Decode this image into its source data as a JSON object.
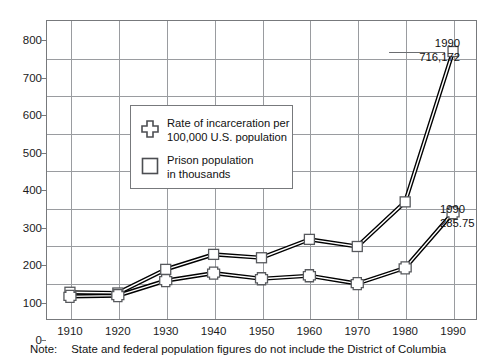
{
  "chart_data": {
    "type": "line",
    "title": "",
    "xlabel": "",
    "ylabel": "",
    "x": [
      1910,
      1920,
      1930,
      1940,
      1950,
      1960,
      1970,
      1980,
      1990
    ],
    "xticklabels": [
      "1910",
      "1920",
      "1930",
      "1940",
      "1950",
      "1960",
      "1970",
      "1980",
      "1990"
    ],
    "yticklabels": [
      "0",
      "100",
      "200",
      "300",
      "400",
      "500",
      "600",
      "700",
      "800"
    ],
    "ylim": [
      0,
      800
    ],
    "ytick_step": 100,
    "xlim": [
      1905,
      1995
    ],
    "grid": true,
    "legend_position": "inside-upper-left",
    "series": [
      {
        "name": "Prison population in thousands",
        "marker": "square",
        "values": [
          74,
          72,
          135,
          175,
          166,
          215,
          196,
          315,
          716
        ]
      },
      {
        "name": "Rate of incarceration per 100,000 U.S. population",
        "marker": "cross",
        "values": [
          63,
          65,
          105,
          125,
          110,
          118,
          97,
          139,
          286
        ]
      }
    ],
    "annotations": [
      {
        "id": "square-1990",
        "year": "1990",
        "value": "716,172",
        "series": "Prison population in thousands"
      },
      {
        "id": "cross-1990",
        "year": "1990",
        "value": "285.75",
        "series": "Rate of incarceration per 100,000 U.S. population"
      }
    ]
  },
  "legend": {
    "items": [
      {
        "marker": "cross",
        "label": "Rate of incarceration per\n100,000 U.S. population"
      },
      {
        "marker": "square",
        "label": "Prison population\nin thousands"
      }
    ]
  },
  "note": {
    "label": "Note:",
    "text": "State and federal population figures do not include the District of Columbia"
  },
  "colors": {
    "line": "#000000",
    "grid": "#9a9ca0",
    "frame": "#77797c",
    "text": "#111111",
    "marker_fill": "#ffffff"
  }
}
